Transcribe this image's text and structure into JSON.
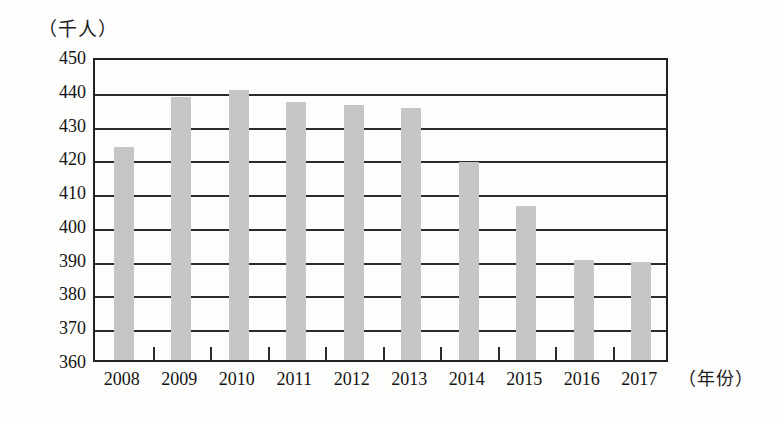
{
  "chart_data": {
    "type": "bar",
    "title": "",
    "subtitle": "",
    "xlabel": "（年份）",
    "ylabel": "（千人）",
    "categories": [
      "2008",
      "2009",
      "2010",
      "2011",
      "2012",
      "2013",
      "2014",
      "2015",
      "2016",
      "2017"
    ],
    "values": [
      423,
      438,
      440,
      436.5,
      435.5,
      434.5,
      418.5,
      405.5,
      389.5,
      389
    ],
    "ylim": [
      360,
      450
    ],
    "ytick_labels": [
      "450",
      "440",
      "430",
      "420",
      "410",
      "400",
      "390",
      "380",
      "370",
      "360"
    ],
    "ytick_values": [
      450,
      440,
      430,
      420,
      410,
      400,
      390,
      380,
      370,
      360
    ],
    "y_tick_step": 10,
    "grid": true,
    "legend": false,
    "legend_position": "none",
    "bar_color": "#c6c6c6",
    "axis_color": "#2b2b2b",
    "background_color": "#fdfdfb",
    "annotations": []
  }
}
